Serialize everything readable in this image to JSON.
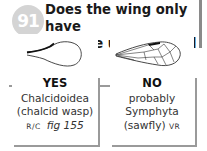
{
  "question": {
    "number": "91",
    "text_line1": "Does the wing only have",
    "text_line2": "a single unbranched vein?"
  },
  "options": [
    {
      "answer": "YES",
      "taxon": "Chalcidoidea",
      "common_name": "(chalcid wasp)",
      "abundance": "R/C",
      "figure_ref": "fig 155",
      "illustration": "wing-single-vein-icon"
    },
    {
      "answer": "NO",
      "qualifier": "probably",
      "taxon": "Symphyta",
      "common_name": "(sawfly)",
      "abundance": "VR",
      "illustration": "wing-branched-veins-icon"
    }
  ],
  "colors": {
    "badge": "#d4d4d4",
    "border": "#9a9a9a",
    "text": "#222222"
  }
}
